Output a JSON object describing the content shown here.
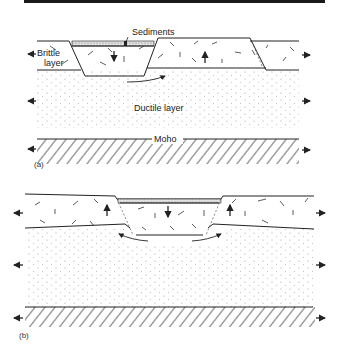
{
  "figure": {
    "panels": [
      {
        "id": "a",
        "label": "(a)",
        "labels": {
          "sediments": "Sediments",
          "brittle_line1": "Brittle",
          "brittle_line2": "layer",
          "ductile": "Ductile layer",
          "moho": "Moho"
        }
      },
      {
        "id": "b",
        "label": "(b)"
      }
    ],
    "colors": {
      "line": "#222222",
      "dots": "#9a9a9a",
      "sediment_fill": "#cfcfcf",
      "background": "#ffffff"
    }
  }
}
